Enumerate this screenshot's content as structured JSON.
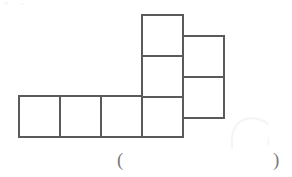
{
  "page": {
    "width": 292,
    "height": 177,
    "background_color": "#ffffff"
  },
  "figure": {
    "name": "cube-net",
    "stroke_color": "#5a5a5a",
    "stroke_width": 2,
    "fill_color": "#ffffff",
    "cell_size": 41,
    "squares": [
      {
        "id": "bottom-1",
        "label": "",
        "x": 19,
        "y": 96,
        "w": 41,
        "h": 41
      },
      {
        "id": "bottom-2",
        "label": "",
        "x": 60,
        "y": 96,
        "w": 41,
        "h": 41
      },
      {
        "id": "bottom-3",
        "label": "",
        "x": 101,
        "y": 96,
        "w": 41,
        "h": 41
      },
      {
        "id": "bottom-4",
        "label": "",
        "x": 142,
        "y": 96,
        "w": 41,
        "h": 41
      },
      {
        "id": "middle-top",
        "label": "",
        "x": 142,
        "y": 15,
        "w": 41,
        "h": 41
      },
      {
        "id": "middle-mid",
        "label": "",
        "x": 142,
        "y": 56,
        "w": 41,
        "h": 41
      },
      {
        "id": "right-top",
        "label": "",
        "x": 183,
        "y": 36,
        "w": 41,
        "h": 41
      },
      {
        "id": "right-bottom",
        "label": "",
        "x": 183,
        "y": 77,
        "w": 41,
        "h": 41
      }
    ]
  },
  "answer": {
    "open_paren": "(",
    "close_paren": ")",
    "value": "",
    "placeholder": ""
  }
}
